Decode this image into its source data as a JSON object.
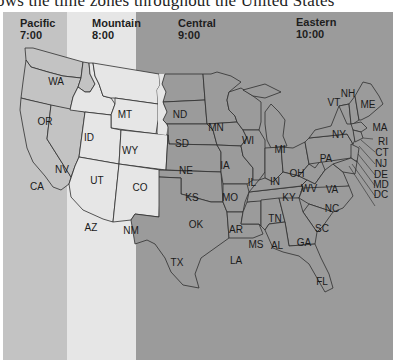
{
  "caption": "ows the time zones throughout the United States",
  "zones": [
    {
      "name": "Pacific",
      "time": "7:00",
      "color": "#c3c3c3"
    },
    {
      "name": "Mountain",
      "time": "8:00",
      "color": "#e6e6e6"
    },
    {
      "name": "Central",
      "time": "9:00",
      "color": "#9b9b9b"
    },
    {
      "name": "Eastern",
      "time": "10:00",
      "color": "#9b9b9b"
    }
  ],
  "states": [
    {
      "abbr": "WA",
      "x": 56,
      "y": 81
    },
    {
      "abbr": "OR",
      "x": 45,
      "y": 121
    },
    {
      "abbr": "CA",
      "x": 37,
      "y": 186
    },
    {
      "abbr": "NV",
      "x": 62,
      "y": 169
    },
    {
      "abbr": "ID",
      "x": 89,
      "y": 137
    },
    {
      "abbr": "MT",
      "x": 125,
      "y": 114
    },
    {
      "abbr": "WY",
      "x": 130,
      "y": 150
    },
    {
      "abbr": "UT",
      "x": 97,
      "y": 180
    },
    {
      "abbr": "CO",
      "x": 140,
      "y": 187
    },
    {
      "abbr": "AZ",
      "x": 91,
      "y": 227
    },
    {
      "abbr": "NM",
      "x": 131,
      "y": 230
    },
    {
      "abbr": "ND",
      "x": 180,
      "y": 114
    },
    {
      "abbr": "SD",
      "x": 182,
      "y": 143
    },
    {
      "abbr": "NE",
      "x": 186,
      "y": 170
    },
    {
      "abbr": "KS",
      "x": 192,
      "y": 197
    },
    {
      "abbr": "OK",
      "x": 196,
      "y": 224
    },
    {
      "abbr": "TX",
      "x": 177,
      "y": 262
    },
    {
      "abbr": "MN",
      "x": 216,
      "y": 127
    },
    {
      "abbr": "IA",
      "x": 225,
      "y": 165
    },
    {
      "abbr": "MO",
      "x": 230,
      "y": 197
    },
    {
      "abbr": "AR",
      "x": 236,
      "y": 229
    },
    {
      "abbr": "LA",
      "x": 236,
      "y": 260
    },
    {
      "abbr": "WI",
      "x": 248,
      "y": 140
    },
    {
      "abbr": "IL",
      "x": 252,
      "y": 182
    },
    {
      "abbr": "MS",
      "x": 256,
      "y": 244
    },
    {
      "abbr": "MI",
      "x": 280,
      "y": 149
    },
    {
      "abbr": "IN",
      "x": 275,
      "y": 181
    },
    {
      "abbr": "KY",
      "x": 289,
      "y": 197
    },
    {
      "abbr": "TN",
      "x": 275,
      "y": 218
    },
    {
      "abbr": "AL",
      "x": 277,
      "y": 245
    },
    {
      "abbr": "OH",
      "x": 297,
      "y": 173
    },
    {
      "abbr": "WV",
      "x": 309,
      "y": 188
    },
    {
      "abbr": "GA",
      "x": 304,
      "y": 242
    },
    {
      "abbr": "FL",
      "x": 322,
      "y": 281
    },
    {
      "abbr": "SC",
      "x": 322,
      "y": 228
    },
    {
      "abbr": "NC",
      "x": 332,
      "y": 208
    },
    {
      "abbr": "VA",
      "x": 332,
      "y": 189
    },
    {
      "abbr": "PA",
      "x": 326,
      "y": 158
    },
    {
      "abbr": "NY",
      "x": 339,
      "y": 134
    },
    {
      "abbr": "VT",
      "x": 334,
      "y": 102
    },
    {
      "abbr": "NH",
      "x": 348,
      "y": 93
    },
    {
      "abbr": "ME",
      "x": 368,
      "y": 104
    },
    {
      "abbr": "MA",
      "x": 380,
      "y": 127
    },
    {
      "abbr": "RI",
      "x": 383,
      "y": 141
    },
    {
      "abbr": "CT",
      "x": 382,
      "y": 152
    },
    {
      "abbr": "NJ",
      "x": 381,
      "y": 163
    },
    {
      "abbr": "DE",
      "x": 381,
      "y": 174
    },
    {
      "abbr": "MD",
      "x": 381,
      "y": 184
    },
    {
      "abbr": "DC",
      "x": 381,
      "y": 194
    }
  ]
}
